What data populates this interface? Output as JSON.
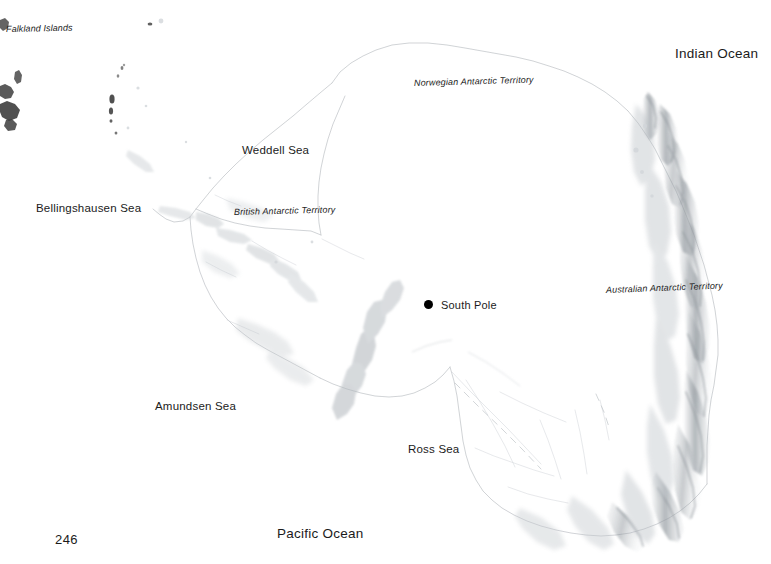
{
  "page": {
    "number": "246",
    "background_color": "#ffffff",
    "text_color": "#1b1b1b",
    "width": 771,
    "height": 564
  },
  "map": {
    "title": "Antarctica",
    "marker_color": "#000000",
    "coastline_color": "#b8bcc0",
    "relief_color": "#9aa0a6",
    "island_color": "#3a3a3a",
    "oceans": [
      {
        "name": "Indian Ocean",
        "x": 675,
        "y": 47
      },
      {
        "name": "Pacific Ocean",
        "x": 277,
        "y": 527
      }
    ],
    "seas": [
      {
        "name": "Weddell Sea",
        "x": 242,
        "y": 145
      },
      {
        "name": "Bellingshausen Sea",
        "x": 36,
        "y": 203
      },
      {
        "name": "Amundsen Sea",
        "x": 155,
        "y": 401
      },
      {
        "name": "Ross Sea",
        "x": 408,
        "y": 444
      }
    ],
    "territories": [
      {
        "name": "Norwegian Antarctic Territory",
        "x": 414,
        "y": 79
      },
      {
        "name": "British Antarctic Territory",
        "x": 234,
        "y": 208
      },
      {
        "name": "Australian Antarctic Territory",
        "x": 606,
        "y": 286
      }
    ],
    "places": [
      {
        "name": "South Pole",
        "x": 441,
        "y": 300,
        "marker_x": 424,
        "marker_y": 300
      }
    ],
    "islands": [
      {
        "name": "Falkland Islands",
        "x": 6,
        "y": 25
      }
    ]
  }
}
